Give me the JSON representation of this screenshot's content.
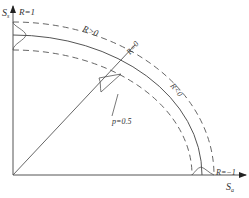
{
  "diagram": {
    "axes": {
      "y_label": "S",
      "y_sub": "s",
      "x_label": "S",
      "x_sub": "a"
    },
    "labels": {
      "r_pos1": "R=1",
      "r_gt0": "R>0",
      "r_eq0": "R=0",
      "r_lt0": "R<0",
      "r_neg1": "R=−1",
      "p": "p=0.5"
    },
    "colors": {
      "line": "#555555",
      "text": "#333333",
      "background": "#ffffff"
    }
  }
}
